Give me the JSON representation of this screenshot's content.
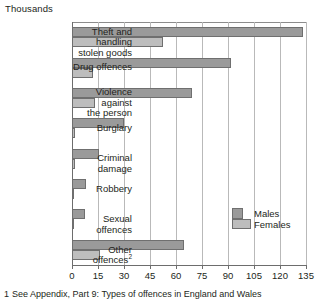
{
  "units_label": "Thousands",
  "footnote": {
    "marker": "1",
    "text": "See Appendix, Part 9: Types of offences in England and Wales"
  },
  "legend": {
    "males_label": "Males",
    "females_label": "Females"
  },
  "colors": {
    "males": "#9a9a9a",
    "females": "#bdbdbd",
    "bar_outline": "#6f6f6f",
    "gridline": "#b9b9b9",
    "axis": "#6d6d6d",
    "text": "#231f20",
    "background": "#ffffff"
  },
  "axis": {
    "tick_labels": [
      "0",
      "15",
      "30",
      "45",
      "60",
      "75",
      "90",
      "105",
      "120",
      "135"
    ]
  },
  "chart_data": {
    "type": "bar",
    "orientation": "horizontal",
    "title": "",
    "subtitle": "",
    "xlabel": "Thousands",
    "ylabel": "",
    "xlim": [
      0,
      135
    ],
    "xticks": [
      0,
      15,
      30,
      45,
      60,
      75,
      90,
      105,
      120,
      135
    ],
    "grid": true,
    "legend_position": "inside-right",
    "categories": [
      "Theft and handling stolen goods",
      "Drug offences",
      "Violence against the person",
      "Burglary",
      "Criminal damage",
      "Robbery",
      "Sexual offences",
      "Other offences"
    ],
    "category_lines": [
      [
        "Theft and handling",
        "stolen goods"
      ],
      [
        "Drug offences"
      ],
      [
        "Violence against",
        "the person"
      ],
      [
        "Burglary"
      ],
      [
        "Criminal damage"
      ],
      [
        "Robbery"
      ],
      [
        "Sexual offences"
      ],
      [
        "Other offences"
      ]
    ],
    "category_footnote_marks": [
      "",
      "",
      "",
      "",
      "",
      "",
      "",
      "2"
    ],
    "series": [
      {
        "name": "Males",
        "color": "#9a9a9a",
        "values": [
          133,
          92,
          69,
          30,
          15.5,
          8,
          7.5,
          64.5
        ]
      },
      {
        "name": "Females",
        "color": "#bdbdbd",
        "values": [
          52.5,
          12,
          13,
          2,
          2,
          1,
          0.3,
          16
        ]
      }
    ]
  }
}
